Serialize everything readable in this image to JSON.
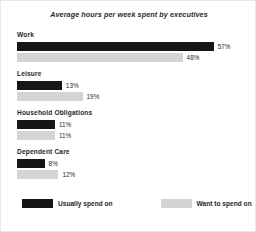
{
  "chart_data": {
    "type": "bar",
    "orientation": "horizontal",
    "title": "Average hours per week spent by executives",
    "xlabel": "",
    "ylabel": "",
    "grid": false,
    "legend_position": "bottom-left",
    "value_suffix": "%",
    "categories": [
      "Work",
      "Leisure",
      "Household Obligations",
      "Dependent Care"
    ],
    "series": [
      {
        "name": "Usually spend on",
        "color": "#161616",
        "values": [
          57,
          13,
          11,
          8
        ],
        "labels": [
          "57%",
          "13%",
          "11%",
          "8%"
        ]
      },
      {
        "name": "Want to spend on",
        "color": "#d4d4d4",
        "values": [
          48,
          19,
          11,
          12
        ],
        "labels": [
          "48%",
          "19%",
          "11%",
          "12%"
        ]
      }
    ],
    "xlim": [
      0,
      60
    ]
  },
  "legend": {
    "items": [
      {
        "label": "Usually spend on",
        "color": "#161616"
      },
      {
        "label": "Want to spend on",
        "color": "#d4d4d4"
      }
    ]
  }
}
